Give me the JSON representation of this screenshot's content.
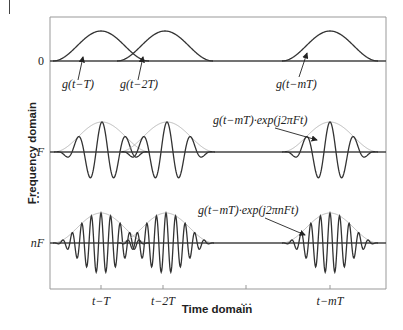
{
  "figure": {
    "frame": {
      "left": 50,
      "top": 17,
      "right": 386,
      "bottom": 289
    },
    "colors": {
      "curve": "#333333",
      "envelope": "#b0b0b0",
      "axis": "#999999",
      "baseline": "#444444"
    },
    "x_axis": {
      "title": "Time domain",
      "ticks": [
        {
          "label": "t−T",
          "x": 101
        },
        {
          "label": "t−2T",
          "x": 163
        },
        {
          "label": "…",
          "x": 246
        },
        {
          "label": "t−mT",
          "x": 330
        }
      ]
    },
    "y_axis": {
      "title": "Frequency domain",
      "ticks": [
        {
          "label": "0",
          "y": 61
        },
        {
          "label": "F",
          "y": 152
        },
        {
          "label": "⋮",
          "y": 197
        },
        {
          "label": "nF",
          "y": 243
        }
      ]
    },
    "rows": [
      {
        "name": "row-zero",
        "baseline": 61,
        "amp": 30,
        "cycles": 0,
        "pulses": [
          {
            "center": 101,
            "half": 48
          },
          {
            "center": 165,
            "half": 48
          },
          {
            "center": 330,
            "half": 48
          }
        ]
      },
      {
        "name": "row-F",
        "baseline": 152,
        "amp": 30,
        "cycles": 2,
        "pulses": [
          {
            "center": 102,
            "half": 48
          },
          {
            "center": 167,
            "half": 48
          },
          {
            "center": 330,
            "half": 48
          }
        ]
      },
      {
        "name": "row-nF",
        "baseline": 243,
        "amp": 30,
        "cycles": 5,
        "pulses": [
          {
            "center": 101,
            "half": 48
          },
          {
            "center": 166,
            "half": 48
          },
          {
            "center": 330,
            "half": 48
          }
        ]
      }
    ],
    "annotations": [
      {
        "text": "g(t−T)",
        "x": 62,
        "y": 88,
        "ax": 78,
        "ay": 80,
        "bx": 83,
        "by": 57
      },
      {
        "text": "g(t−2T)",
        "x": 120,
        "y": 88,
        "ax": 138,
        "ay": 80,
        "bx": 143,
        "by": 57
      },
      {
        "text": "g(t−mT)",
        "x": 276,
        "y": 88,
        "ax": 299,
        "ay": 77,
        "bx": 307,
        "by": 53
      },
      {
        "text": "g(t−mT)·exp(j2πFt)",
        "x": 213,
        "y": 124,
        "ax": 275,
        "ay": 128,
        "bx": 317,
        "by": 140
      },
      {
        "text": "g(t−mT)·exp(j2πnFt)",
        "x": 198,
        "y": 214,
        "ax": 265,
        "ay": 218,
        "bx": 305,
        "by": 235
      }
    ]
  }
}
